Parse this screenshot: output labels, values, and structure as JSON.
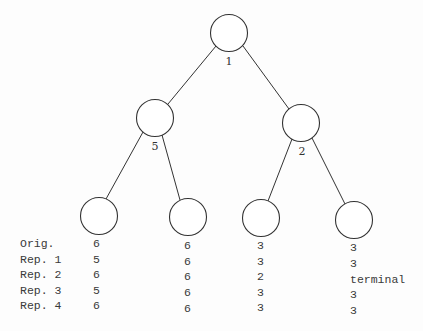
{
  "diagram": {
    "type": "binary-tree",
    "stroke_color": "#333333",
    "nodes": [
      {
        "id": "root",
        "label": "1",
        "cx": 229,
        "cy": 33
      },
      {
        "id": "left",
        "label": "5",
        "cx": 155,
        "cy": 118
      },
      {
        "id": "right",
        "label": "2",
        "cx": 301,
        "cy": 123
      },
      {
        "id": "leaf1",
        "label": "",
        "cx": 99,
        "cy": 216
      },
      {
        "id": "leaf2",
        "label": "",
        "cx": 188,
        "cy": 217
      },
      {
        "id": "leaf3",
        "label": "",
        "cx": 261,
        "cy": 218
      },
      {
        "id": "leaf4",
        "label": "",
        "cx": 354,
        "cy": 220
      }
    ],
    "edges": [
      [
        "root",
        "left"
      ],
      [
        "root",
        "right"
      ],
      [
        "left",
        "leaf1"
      ],
      [
        "left",
        "leaf2"
      ],
      [
        "right",
        "leaf3"
      ],
      [
        "right",
        "leaf4"
      ]
    ]
  },
  "table": {
    "row_labels": [
      "Orig.",
      "Rep. 1",
      "Rep. 2",
      "Rep. 3",
      "Rep. 4"
    ],
    "columns": [
      {
        "leaf": "leaf1",
        "values": [
          "6",
          "5",
          "6",
          "5",
          "6"
        ]
      },
      {
        "leaf": "leaf2",
        "values": [
          "6",
          "6",
          "6",
          "6",
          "6"
        ]
      },
      {
        "leaf": "leaf3",
        "values": [
          "3",
          "3",
          "2",
          "3",
          "3"
        ]
      },
      {
        "leaf": "leaf4",
        "values": [
          "3",
          "3",
          "terminal",
          "3",
          "3"
        ]
      }
    ]
  }
}
